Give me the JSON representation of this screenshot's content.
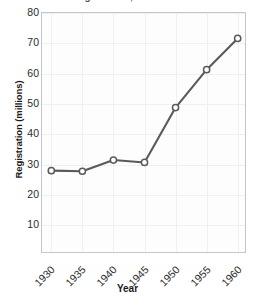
{
  "chart_data": {
    "type": "line",
    "title": "Registration, 1930-1960",
    "xlabel": "Year",
    "ylabel": "Registration (millions)",
    "x": [
      1930,
      1935,
      1940,
      1945,
      1950,
      1955,
      1960
    ],
    "values": [
      28.0,
      27.8,
      31.5,
      30.7,
      48.8,
      61.3,
      71.6
    ],
    "xticklabels": [
      "1930",
      "1935",
      "1940",
      "1945",
      "1950",
      "1955",
      "1960"
    ],
    "yticklabels": [
      "10",
      "20",
      "30",
      "40",
      "50",
      "60",
      "70",
      "80"
    ],
    "yticks": [
      10,
      20,
      30,
      40,
      50,
      60,
      70,
      80
    ],
    "xlim": [
      1928.5,
      1961.5
    ],
    "ylim": [
      0.5,
      80
    ],
    "grid": true,
    "legend": false,
    "marker": "open-circle",
    "line_color": "#5a5a5a",
    "marker_fill": "#ffffff",
    "grid_color": "#f0f0f0",
    "frame_color": "#c6c6c6"
  }
}
